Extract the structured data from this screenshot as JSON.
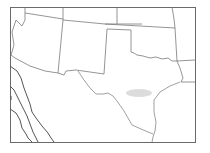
{
  "map": {
    "title": "",
    "region": "Southwestern United States",
    "highlight": {
      "label": "",
      "color": "#d6d6d6",
      "location": "central Texas"
    },
    "colors": {
      "background": "#ffffff",
      "lines": "#7a7a7a",
      "frame": "#6a6a6a"
    }
  }
}
